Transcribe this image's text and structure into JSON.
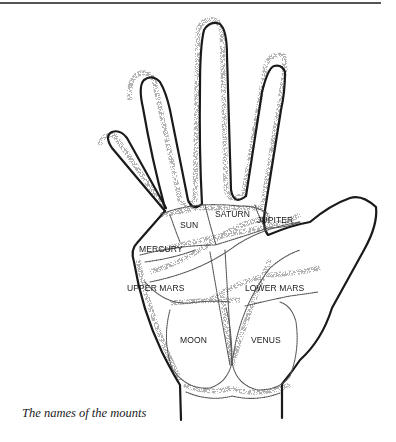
{
  "figure": {
    "caption": "The names of the mounts",
    "mounts": [
      {
        "id": "sun",
        "label": "SUN"
      },
      {
        "id": "saturn",
        "label": "SATURN"
      },
      {
        "id": "jupiter",
        "label": "JUPITER"
      },
      {
        "id": "mercury",
        "label": "MERCURY"
      },
      {
        "id": "upper-mars",
        "label": "UPPER MARS"
      },
      {
        "id": "lower-mars",
        "label": "LOWER MARS"
      },
      {
        "id": "moon",
        "label": "MOON"
      },
      {
        "id": "venus",
        "label": "VENUS"
      }
    ]
  },
  "colors": {
    "ink": "#1a1a1a",
    "stipple": "#666666",
    "background": "#ffffff"
  }
}
